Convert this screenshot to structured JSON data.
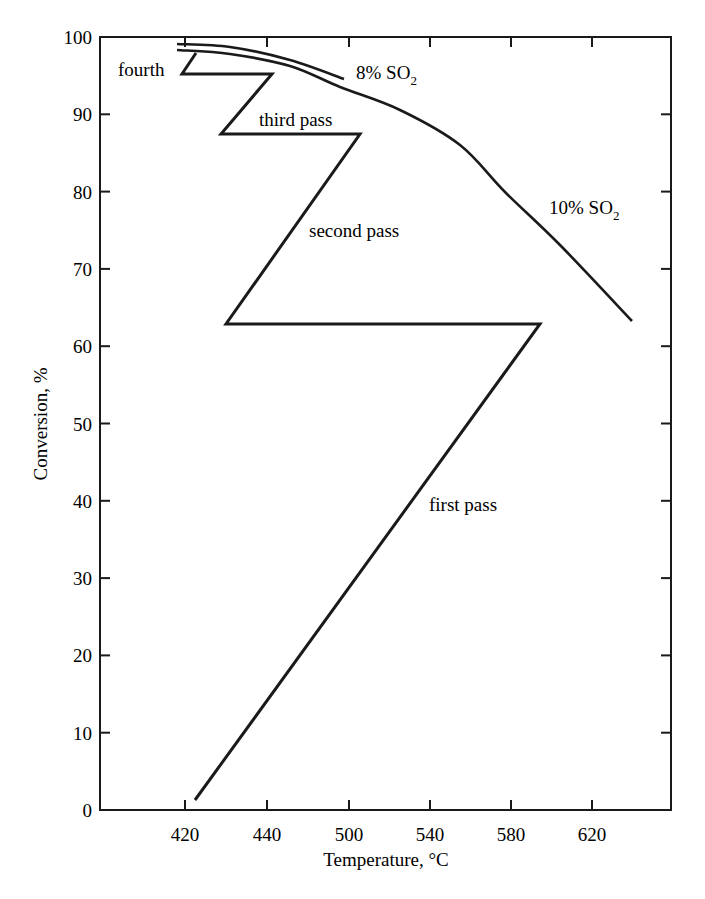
{
  "chart_data": {
    "type": "line",
    "title": "",
    "xlabel": "Temperature, °C",
    "ylabel": "Conversion, %",
    "x_tick_labels": [
      "420",
      "440",
      "500",
      "540",
      "580",
      "620"
    ],
    "y_tick_labels": [
      "0",
      "10",
      "20",
      "30",
      "40",
      "50",
      "60",
      "70",
      "80",
      "90",
      "100"
    ],
    "ylim": [
      0,
      100
    ],
    "grid": false,
    "legend": "none (inline annotations)",
    "note": "x values below are in the chart's own axis units interpolated between the printed tick labels (tick spacing is uniform on the page although labels are irregular)",
    "series": [
      {
        "name": "Multi-pass converter operating line",
        "points": [
          {
            "x": 422,
            "y": 1.3
          },
          {
            "x": 584,
            "y": 62.9
          },
          {
            "x": 428,
            "y": 62.9
          },
          {
            "x": 502,
            "y": 87.5
          },
          {
            "x": 427,
            "y": 87.5
          },
          {
            "x": 441,
            "y": 95.3
          },
          {
            "x": 419,
            "y": 95.3
          },
          {
            "x": 422,
            "y": 98.0
          }
        ]
      },
      {
        "name": "10% SO2 equilibrium curve",
        "points": [
          {
            "x": 418,
            "y": 98.3
          },
          {
            "x": 460,
            "y": 97.0
          },
          {
            "x": 497,
            "y": 93.5
          },
          {
            "x": 513,
            "y": 90.6
          },
          {
            "x": 527,
            "y": 86.0
          },
          {
            "x": 538,
            "y": 80.0
          },
          {
            "x": 551,
            "y": 73.0
          },
          {
            "x": 571,
            "y": 63.2
          }
        ]
      },
      {
        "name": "8% SO2 equilibrium curve",
        "points": [
          {
            "x": 418,
            "y": 99.1
          },
          {
            "x": 460,
            "y": 98.0
          },
          {
            "x": 497,
            "y": 94.3
          }
        ]
      }
    ],
    "annotations": [
      {
        "text": "fourth",
        "x": 414,
        "y": 96.5
      },
      {
        "text": "third pass",
        "x": 460,
        "y": 89.5
      },
      {
        "text": "second pass",
        "x": 520,
        "y": 74.5
      },
      {
        "text": "first pass",
        "x": 545,
        "y": 40.5
      },
      {
        "text": "8% SO",
        "sub": "2",
        "x": 503,
        "y": 95.5
      },
      {
        "text": "10% SO",
        "sub": "2",
        "x": 580,
        "y": 77.5
      }
    ]
  },
  "layout": {
    "plot_left": 100,
    "plot_right": 671,
    "plot_top": 37,
    "plot_bottom": 810,
    "x_tick_px": [
      185,
      267,
      349,
      430,
      511,
      592
    ],
    "line_color": "#1a1a1a"
  },
  "paths_px": {
    "passes": [
      [
        195,
        800
      ],
      [
        540,
        324
      ],
      [
        226,
        324
      ],
      [
        360,
        134
      ],
      [
        221,
        134
      ],
      [
        272,
        74
      ],
      [
        182,
        74
      ],
      [
        196,
        53
      ]
    ],
    "curve_10": [
      [
        177,
        50
      ],
      [
        230,
        54
      ],
      [
        290,
        66
      ],
      [
        340,
        87
      ],
      [
        400,
        110
      ],
      [
        460,
        145
      ],
      [
        505,
        192
      ],
      [
        560,
        245
      ],
      [
        632,
        321
      ]
    ],
    "curve_8": [
      [
        177,
        44
      ],
      [
        230,
        47
      ],
      [
        290,
        60
      ],
      [
        344,
        79
      ]
    ]
  },
  "labels_px": {
    "fourth": [
      118,
      76
    ],
    "third": [
      259,
      126
    ],
    "second": [
      309,
      237
    ],
    "first": [
      429,
      511
    ],
    "so2_8": [
      356,
      79
    ],
    "so2_10": [
      549,
      214
    ]
  }
}
